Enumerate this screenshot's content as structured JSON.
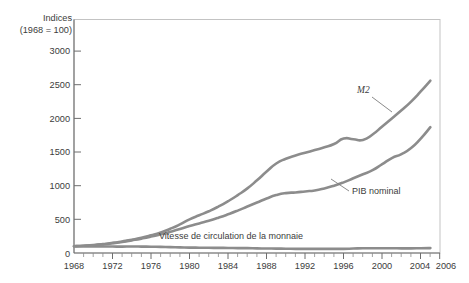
{
  "chart_data": {
    "type": "line",
    "title": "",
    "subtitle": "",
    "ylabel_line1": "Indices",
    "ylabel_line2": "(1968 = 100)",
    "xlabel": "",
    "xlim": [
      1968,
      2006
    ],
    "ylim": [
      0,
      3000
    ],
    "grid": false,
    "legend": "inline-annotations",
    "yticks": [
      0,
      500,
      1000,
      1500,
      2000,
      2500,
      3000
    ],
    "ytick_labels": [
      "0",
      "500",
      "1000",
      "1500",
      "2000",
      "2500",
      "3000"
    ],
    "xticks": [
      1968,
      1972,
      1976,
      1980,
      1984,
      1988,
      1992,
      1996,
      2000,
      2004,
      2006
    ],
    "xtick_labels": [
      "1968",
      "1972",
      "1976",
      "1980",
      "1984",
      "1988",
      "1992",
      "1996",
      "2000",
      "2004",
      "2006"
    ],
    "x": [
      1968,
      1969,
      1970,
      1971,
      1972,
      1973,
      1974,
      1975,
      1976,
      1977,
      1978,
      1979,
      1980,
      1981,
      1982,
      1983,
      1984,
      1985,
      1986,
      1987,
      1988,
      1989,
      1990,
      1991,
      1992,
      1993,
      1994,
      1995,
      1996,
      1997,
      1998,
      1999,
      2000,
      2001,
      2002,
      2003,
      2004,
      2005
    ],
    "series": [
      {
        "name": "M2",
        "label": "M2",
        "color": "#8c8c8c",
        "values": [
          100,
          108,
          118,
          132,
          150,
          172,
          196,
          225,
          262,
          305,
          360,
          425,
          500,
          560,
          620,
          690,
          770,
          860,
          960,
          1080,
          1210,
          1330,
          1400,
          1450,
          1490,
          1530,
          1570,
          1620,
          1700,
          1690,
          1680,
          1760,
          1880,
          2000,
          2120,
          2250,
          2400,
          2560
        ]
      },
      {
        "name": "PIB nominal",
        "label": "PIB nominal",
        "color": "#8c8c8c",
        "values": [
          100,
          107,
          116,
          128,
          144,
          164,
          188,
          214,
          244,
          278,
          315,
          355,
          400,
          440,
          480,
          525,
          575,
          630,
          690,
          750,
          810,
          860,
          890,
          900,
          915,
          930,
          960,
          1000,
          1050,
          1110,
          1170,
          1230,
          1320,
          1410,
          1470,
          1560,
          1700,
          1870
        ]
      },
      {
        "name": "Vitesse de circulation de la monnaie",
        "label": "Vitesse de circulation de la monnaie",
        "color": "#8c8c8c",
        "values": [
          100,
          99,
          98,
          97,
          96,
          95,
          96,
          95,
          93,
          91,
          88,
          84,
          80,
          79,
          77,
          76,
          75,
          73,
          72,
          69,
          67,
          65,
          64,
          62,
          61,
          61,
          61,
          62,
          62,
          66,
          70,
          70,
          70,
          71,
          69,
          69,
          71,
          73
        ]
      }
    ],
    "annotations": [
      {
        "text": "M2",
        "style": "italic"
      },
      {
        "text": "PIB nominal",
        "style": "normal"
      },
      {
        "text": "Vitesse de circulation de la monnaie",
        "style": "normal"
      }
    ]
  }
}
